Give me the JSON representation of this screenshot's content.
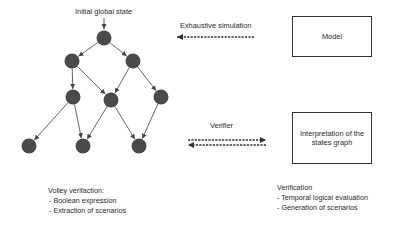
{
  "diagram": {
    "tree": {
      "root_label": "Initial global state",
      "node_color": "#4a4a4a",
      "edge_color": "#555555",
      "nodes": [
        {
          "id": "n0",
          "x": 104,
          "y": 38
        },
        {
          "id": "n1",
          "x": 72,
          "y": 61
        },
        {
          "id": "n2",
          "x": 133,
          "y": 61
        },
        {
          "id": "n3",
          "x": 73,
          "y": 97
        },
        {
          "id": "n4",
          "x": 111,
          "y": 100
        },
        {
          "id": "n5",
          "x": 161,
          "y": 97
        },
        {
          "id": "n6",
          "x": 29,
          "y": 146
        },
        {
          "id": "n7",
          "x": 83,
          "y": 146
        },
        {
          "id": "n8",
          "x": 139,
          "y": 146
        }
      ],
      "edges": [
        [
          "n0",
          "n1"
        ],
        [
          "n0",
          "n2"
        ],
        [
          "n1",
          "n3"
        ],
        [
          "n1",
          "n4"
        ],
        [
          "n2",
          "n4"
        ],
        [
          "n2",
          "n5"
        ],
        [
          "n3",
          "n6"
        ],
        [
          "n3",
          "n7"
        ],
        [
          "n4",
          "n7"
        ],
        [
          "n4",
          "n8"
        ],
        [
          "n5",
          "n8"
        ]
      ]
    },
    "arrows": {
      "exhaustive_simulation": {
        "label": "Exhaustive simulation",
        "direction": "left"
      },
      "verifier": {
        "label": "Verifier",
        "direction": "bidirectional"
      }
    },
    "boxes": {
      "model": {
        "label": "Model"
      },
      "interpretation": {
        "label": "Interpretation of the states graph"
      }
    },
    "notes": {
      "left": {
        "title": "Volley verifaction:",
        "items": [
          "- Boolean expression",
          "- Extraction of scenarios"
        ]
      },
      "right": {
        "title": "Verification",
        "items": [
          "- Temporal logical evaluation",
          "- Generation of scenarios"
        ]
      }
    }
  }
}
